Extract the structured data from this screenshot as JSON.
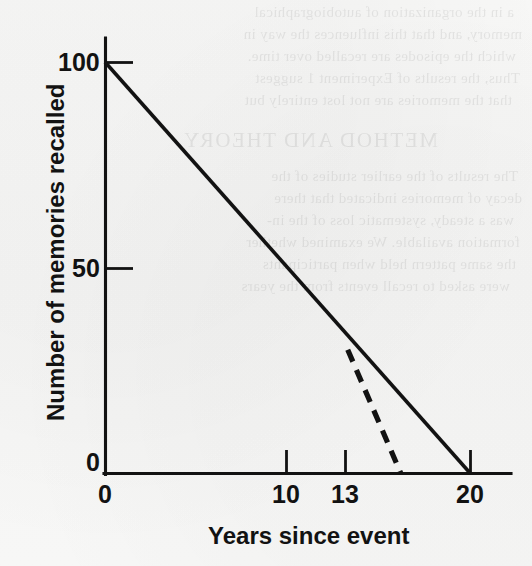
{
  "figure": {
    "background_color": "#f7f7f6",
    "ink_color": "#121212"
  },
  "chart_data": {
    "type": "line",
    "title": "",
    "xlabel": "Years since event",
    "ylabel": "Number of memories recalled",
    "xlim": [
      0,
      20
    ],
    "ylim": [
      0,
      100
    ],
    "xticks": [
      0,
      10,
      13,
      20
    ],
    "xtick_labels": [
      "0",
      "10",
      "13",
      "20"
    ],
    "yticks": [
      0,
      50,
      100
    ],
    "ytick_labels": [
      "0",
      "50",
      "100"
    ],
    "grid": false,
    "legend": false,
    "series": [
      {
        "name": "Gradual forgetting (observed)",
        "style": "solid",
        "x": [
          0,
          20
        ],
        "y": [
          100,
          0
        ]
      },
      {
        "name": "Accelerated forgetting (projected)",
        "style": "dashed",
        "x": [
          13.3,
          16.2
        ],
        "y": [
          30,
          0
        ]
      }
    ],
    "annotations": []
  },
  "axes": {
    "y_title": "Number of memories recalled",
    "x_title": "Years since event",
    "y_tick_labels": [
      "100",
      "50",
      "0"
    ],
    "x_tick_labels": [
      "0",
      "10",
      "13",
      "20"
    ]
  },
  "showthrough": {
    "lines": [
      "a in the organization of autobiographical",
      "memory, and that this influences the way in",
      "which the episodes are recalled over time.",
      "Thus, the results of Experiment 1 suggest",
      "that the memories are not lost entirely but",
      "",
      "METHOD AND THEORY",
      "",
      "The results of the earlier studies of the",
      "decay of memories indicated that there",
      "was a steady, systematic loss of the in-",
      "formation available. We examined whether",
      "the same pattern held when participants",
      "were asked to recall events from the years"
    ]
  }
}
